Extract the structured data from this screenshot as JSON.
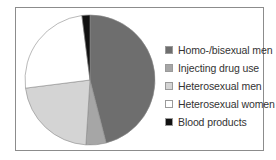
{
  "chart_data": {
    "type": "pie",
    "title": "",
    "start_angle_deg": 0,
    "direction": "clockwise",
    "legend_position": "right",
    "slices": [
      {
        "label": "Homo-/bisexual men",
        "value": 46,
        "color": "#6e6e6e"
      },
      {
        "label": "Injecting drug use",
        "value": 5,
        "color": "#a6a6a6"
      },
      {
        "label": "Heterosexual men",
        "value": 22,
        "color": "#d4d4d4"
      },
      {
        "label": "Heterosexual women",
        "value": 25,
        "color": "#ffffff"
      },
      {
        "label": "Blood products",
        "value": 2,
        "color": "#111111"
      }
    ]
  },
  "legend": {
    "items": [
      {
        "label": "Homo-/bisexual men",
        "color": "#6e6e6e"
      },
      {
        "label": "Injecting drug use",
        "color": "#a6a6a6"
      },
      {
        "label": "Heterosexual men",
        "color": "#d4d4d4"
      },
      {
        "label": "Heterosexual women",
        "color": "#ffffff"
      },
      {
        "label": "Blood products",
        "color": "#111111"
      }
    ]
  }
}
